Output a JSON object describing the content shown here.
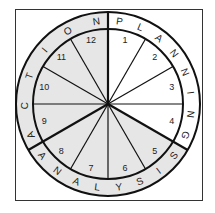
{
  "diagram": {
    "title": "",
    "colors": {
      "background": "#ffffff",
      "shaded": "#e6e6e6",
      "stroke": "#111111",
      "frame": "#333333"
    },
    "phases": [
      {
        "label": "PLANNING",
        "segments": [
          1,
          2,
          3,
          4
        ],
        "shaded": false
      },
      {
        "label": "ANALYSIS",
        "segments": [
          5,
          6,
          7,
          8
        ],
        "shaded": true
      },
      {
        "label": "ACTION",
        "segments": [
          9,
          10,
          11,
          12
        ],
        "shaded": true
      }
    ],
    "segment_numbers": [
      "1",
      "2",
      "3",
      "4",
      "5",
      "6",
      "7",
      "8",
      "9",
      "10",
      "11",
      "12"
    ]
  }
}
